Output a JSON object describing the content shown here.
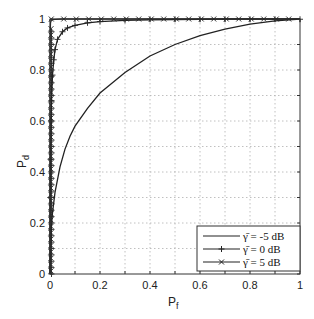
{
  "chart_data": {
    "type": "line",
    "title": "",
    "xlabel": "P_f",
    "ylabel": "P_d",
    "xlabel_main": "P",
    "xlabel_sub": "f",
    "ylabel_main": "P",
    "ylabel_sub": "d",
    "xlim": [
      0,
      1
    ],
    "ylim": [
      0,
      1
    ],
    "grid": true,
    "legend_position": "lower right",
    "xticks": [
      0,
      0.2,
      0.4,
      0.6,
      0.8,
      1
    ],
    "xtick_labels": [
      "0",
      "0.2",
      "0.4",
      "0.6",
      "0.8",
      "1"
    ],
    "yticks": [
      0,
      0.2,
      0.4,
      0.6,
      0.8,
      1
    ],
    "ytick_labels": [
      "0",
      "0.2",
      "0.4",
      "0.6",
      "0.8",
      "1"
    ],
    "series": [
      {
        "name": "γ̄ = -5 dB",
        "marker": "none",
        "x": [
          0,
          0.005,
          0.01,
          0.02,
          0.04,
          0.06,
          0.08,
          0.1,
          0.15,
          0.2,
          0.25,
          0.3,
          0.4,
          0.5,
          0.6,
          0.7,
          0.8,
          0.9,
          1.0
        ],
        "y": [
          0,
          0.18,
          0.24,
          0.32,
          0.42,
          0.49,
          0.54,
          0.58,
          0.65,
          0.71,
          0.75,
          0.79,
          0.855,
          0.9,
          0.935,
          0.96,
          0.98,
          0.993,
          1.0
        ]
      },
      {
        "name": "γ̄ = 0 dB",
        "marker": "+",
        "x": [
          0,
          0.001,
          0.002,
          0.004,
          0.006,
          0.01,
          0.015,
          0.02,
          0.03,
          0.05,
          0.07,
          0.1,
          0.15,
          0.2,
          0.3,
          0.4,
          0.5,
          0.6,
          0.7,
          0.8,
          0.9,
          1.0
        ],
        "y": [
          0,
          0.3,
          0.45,
          0.6,
          0.68,
          0.78,
          0.84,
          0.88,
          0.92,
          0.95,
          0.965,
          0.975,
          0.985,
          0.99,
          0.995,
          0.997,
          0.998,
          0.999,
          1.0,
          1.0,
          1.0,
          1.0
        ]
      },
      {
        "name": "γ̄ = 5 dB",
        "marker": "x",
        "x": [
          0,
          0.0005,
          0.001,
          0.002,
          0.005,
          0.01,
          0.02,
          0.05,
          0.1,
          0.2,
          0.3,
          0.4,
          0.5,
          0.6,
          0.7,
          0.8,
          0.9,
          1.0
        ],
        "y": [
          0,
          0.9,
          0.96,
          0.985,
          0.995,
          0.998,
          0.999,
          1.0,
          1.0,
          1.0,
          1.0,
          1.0,
          1.0,
          1.0,
          1.0,
          1.0,
          1.0,
          1.0
        ]
      }
    ]
  },
  "legend": {
    "items": [
      {
        "label": "γ̄ = -5 dB"
      },
      {
        "label": "γ̄ = 0 dB"
      },
      {
        "label": "γ̄ = 5 dB"
      }
    ]
  },
  "colors": {
    "line": "#222222",
    "grid": "#b0b0b0",
    "axis": "#333333"
  }
}
